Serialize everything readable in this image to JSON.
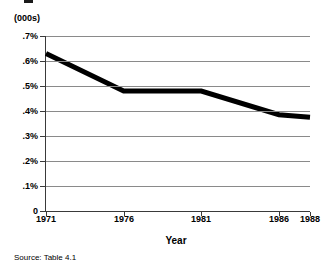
{
  "units_label": "(000s)",
  "source_note": "Source:  Table 4.1",
  "axis_title_x": "Year",
  "colors": {
    "line": "#000000",
    "grid": "#8a8a8a",
    "axis": "#3a3a3a",
    "background": "#ffffff"
  },
  "chart_data": {
    "type": "line",
    "title": "",
    "subtitle": "(000s)",
    "xlabel": "Year",
    "ylabel": "",
    "x": [
      1971,
      1976,
      1981,
      1986,
      1988
    ],
    "categories": [
      "1971",
      "1976",
      "1981",
      "1986",
      "1988"
    ],
    "values": [
      0.63,
      0.48,
      0.48,
      0.385,
      0.375
    ],
    "series": [
      {
        "name": "rate",
        "values": [
          0.63,
          0.48,
          0.48,
          0.385,
          0.375
        ]
      }
    ],
    "xlim": [
      1971,
      1988
    ],
    "ylim": [
      0,
      0.7
    ],
    "ytick_values": [
      0,
      0.1,
      0.2,
      0.3,
      0.4,
      0.5,
      0.6,
      0.7
    ],
    "ytick_labels": [
      "0",
      ".1%",
      ".2%",
      ".3%",
      ".4%",
      ".5%",
      ".6%",
      ".7%"
    ],
    "xtick_labels": [
      "1971",
      "1976",
      "1981",
      "1986",
      "1988"
    ],
    "grid": "horizontal",
    "legend": "none",
    "annotations": [
      "Source:  Table 4.1"
    ]
  }
}
